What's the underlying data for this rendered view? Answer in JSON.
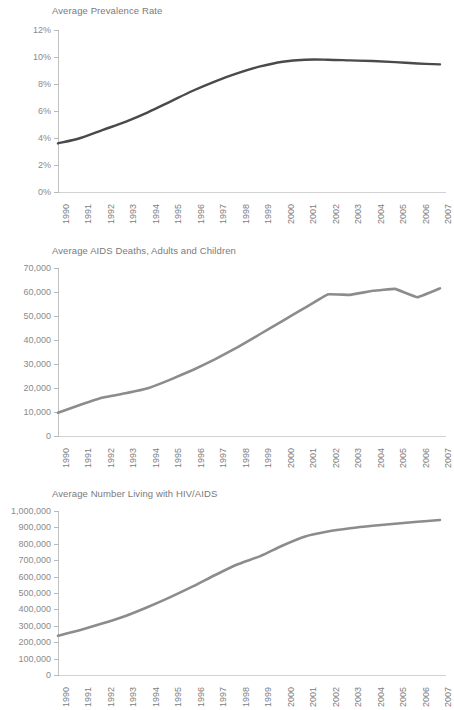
{
  "page": {
    "background": "#ffffff",
    "text_color": "#6e6e6e"
  },
  "charts": [
    {
      "id": "prevalence",
      "title": "Average Prevalence Rate",
      "line_color": "#4a4a4a",
      "y_ticks": [
        "12%",
        "10%",
        "8%",
        "6%",
        "4%",
        "2%",
        "0%"
      ],
      "x_labels": [
        "1990",
        "1991",
        "1992",
        "1993",
        "1994",
        "1995",
        "1996",
        "1997",
        "1998",
        "1999",
        "2000",
        "2001",
        "2002",
        "2003",
        "2004",
        "2005",
        "2006",
        "2007"
      ]
    },
    {
      "id": "aids-deaths",
      "title": "Average AIDS Deaths, Adults and Children",
      "line_color": "#8c8c8c",
      "y_ticks": [
        "70,000",
        "60,000",
        "50,000",
        "40,000",
        "30,000",
        "20,000",
        "10,000",
        "0"
      ],
      "x_labels": [
        "1990",
        "1991",
        "1992",
        "1993",
        "1994",
        "1995",
        "1996",
        "1997",
        "1998",
        "1999",
        "2000",
        "2001",
        "2002",
        "2003",
        "2004",
        "2005",
        "2006",
        "2007"
      ]
    },
    {
      "id": "living-with-hiv",
      "title": "Average Number Living with HIV/AIDS",
      "line_color": "#8c8c8c",
      "y_ticks": [
        "1,000,000",
        "900,000",
        "800,000",
        "700,000",
        "600,000",
        "500,000",
        "400,000",
        "300,000",
        "200,000",
        "100,000",
        "0"
      ],
      "x_labels": [
        "1990",
        "1991",
        "1992",
        "1993",
        "1994",
        "1995",
        "1996",
        "1997",
        "1998",
        "1999",
        "2000",
        "2001",
        "2002",
        "2003",
        "2004",
        "2005",
        "2006",
        "2007"
      ]
    }
  ],
  "chart_data": [
    {
      "type": "line",
      "title": "Average Prevalence Rate",
      "xlabel": "",
      "ylabel": "",
      "x": [
        1990,
        1991,
        1992,
        1993,
        1994,
        1995,
        1996,
        1997,
        1998,
        1999,
        2000,
        2001,
        2002,
        2003,
        2004,
        2005,
        2006,
        2007
      ],
      "categories": [
        "1990",
        "1991",
        "1992",
        "1993",
        "1994",
        "1995",
        "1996",
        "1997",
        "1998",
        "1999",
        "2000",
        "2001",
        "2002",
        "2003",
        "2004",
        "2005",
        "2006",
        "2007"
      ],
      "values": [
        3.6,
        4.0,
        4.6,
        5.2,
        5.9,
        6.7,
        7.5,
        8.2,
        8.8,
        9.3,
        9.65,
        9.8,
        9.8,
        9.75,
        9.7,
        9.62,
        9.52,
        9.45
      ],
      "unit": "%",
      "ylim": [
        0,
        12
      ],
      "y_ticks": [
        0,
        2,
        4,
        6,
        8,
        10,
        12
      ],
      "y_tick_labels": [
        "0%",
        "2%",
        "4%",
        "6%",
        "8%",
        "10%",
        "12%"
      ],
      "grid": false,
      "legend": null,
      "line_color": "#4a4a4a"
    },
    {
      "type": "line",
      "title": "Average AIDS Deaths, Adults and Children",
      "xlabel": "",
      "ylabel": "",
      "x": [
        1990,
        1991,
        1992,
        1993,
        1994,
        1995,
        1996,
        1997,
        1998,
        1999,
        2000,
        2001,
        2002,
        2003,
        2004,
        2005,
        2006,
        2007
      ],
      "categories": [
        "1990",
        "1991",
        "1992",
        "1993",
        "1994",
        "1995",
        "1996",
        "1997",
        "1998",
        "1999",
        "2000",
        "2001",
        "2002",
        "2003",
        "2004",
        "2005",
        "2006",
        "2007"
      ],
      "values": [
        9700,
        13000,
        16000,
        17800,
        19900,
        23500,
        27500,
        32000,
        37000,
        42500,
        48000,
        53500,
        59000,
        58800,
        60500,
        61300,
        57800,
        61500
      ],
      "unit": "",
      "ylim": [
        0,
        70000
      ],
      "y_ticks": [
        0,
        10000,
        20000,
        30000,
        40000,
        50000,
        60000,
        70000
      ],
      "y_tick_labels": [
        "0",
        "10,000",
        "20,000",
        "30,000",
        "40,000",
        "50,000",
        "60,000",
        "70,000"
      ],
      "grid": false,
      "legend": null,
      "line_color": "#8c8c8c"
    },
    {
      "type": "line",
      "title": "Average Number Living with HIV/AIDS",
      "xlabel": "",
      "ylabel": "",
      "x": [
        1990,
        1991,
        1992,
        1993,
        1994,
        1995,
        1996,
        1997,
        1998,
        1999,
        2000,
        2001,
        2002,
        2003,
        2004,
        2005,
        2006,
        2007
      ],
      "categories": [
        "1990",
        "1991",
        "1992",
        "1993",
        "1994",
        "1995",
        "1996",
        "1997",
        "1998",
        "1999",
        "2000",
        "2001",
        "2002",
        "2003",
        "2004",
        "2005",
        "2006",
        "2007"
      ],
      "values": [
        240000,
        275000,
        315000,
        360000,
        415000,
        475000,
        540000,
        610000,
        675000,
        725000,
        790000,
        845000,
        875000,
        895000,
        910000,
        922000,
        934000,
        945000
      ],
      "unit": "",
      "ylim": [
        0,
        1000000
      ],
      "y_ticks": [
        0,
        100000,
        200000,
        300000,
        400000,
        500000,
        600000,
        700000,
        800000,
        900000,
        1000000
      ],
      "y_tick_labels": [
        "0",
        "100,000",
        "200,000",
        "300,000",
        "400,000",
        "500,000",
        "600,000",
        "700,000",
        "800,000",
        "900,000",
        "1,000,000"
      ],
      "grid": false,
      "legend": null,
      "line_color": "#8c8c8c"
    }
  ]
}
